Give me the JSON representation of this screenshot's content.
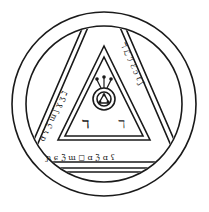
{
  "figure": {
    "kind": "magical seal line drawing",
    "colors": {
      "ink": "#1a1a1a",
      "paper": "#ffffff"
    },
    "outer_circle": {
      "cx": 104,
      "cy": 104,
      "r": 92
    },
    "inner_circle": {
      "cx": 104,
      "cy": 104,
      "r": 78
    },
    "center_emblem": {
      "cx": 104,
      "cy": 92,
      "r_outer": 11,
      "r_inner": 7
    },
    "inner_glyphs": [
      "ℸ",
      "ℸ"
    ],
    "left_band_glyphs": "ɑ ʕ ℨ ɯ ʃ ɣ ʒ ℷ",
    "right_band_glyphs": "ℸ ℒ ℐ ℰ ɔ ℓ ʃ",
    "bottom_band_glyphs": "ɲ ɕ ℨ ɯ ◻ ɑ ℨ ɑ ʕ"
  }
}
